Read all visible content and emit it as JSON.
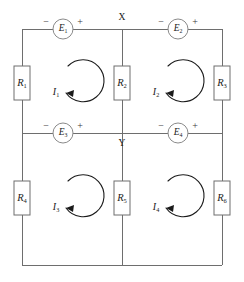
{
  "figure": {
    "background_color": "#ffffff",
    "wire_color": "#6e6e6e",
    "symbol_color": "#8a8a8a",
    "ink_color": "#1a1a1a"
  },
  "nodes": [
    {
      "id": "node-x",
      "label": "X"
    },
    {
      "id": "node-y",
      "label": "Y"
    }
  ],
  "resistors": [
    {
      "id": "r1",
      "label": "R",
      "subscript": "1"
    },
    {
      "id": "r2",
      "label": "R",
      "subscript": "2"
    },
    {
      "id": "r3",
      "label": "R",
      "subscript": "3"
    },
    {
      "id": "r4",
      "label": "R",
      "subscript": "4"
    },
    {
      "id": "r5",
      "label": "R",
      "subscript": "5"
    },
    {
      "id": "r6",
      "label": "R",
      "subscript": "6"
    }
  ],
  "sources": [
    {
      "id": "e1",
      "label": "E",
      "subscript": "1",
      "minus": "−",
      "plus": "+"
    },
    {
      "id": "e2",
      "label": "E",
      "subscript": "2",
      "minus": "−",
      "plus": "+"
    },
    {
      "id": "e3",
      "label": "E",
      "subscript": "3",
      "minus": "−",
      "plus": "+"
    },
    {
      "id": "e4",
      "label": "E",
      "subscript": "4",
      "minus": "−",
      "plus": "+"
    }
  ],
  "currents": [
    {
      "id": "i1",
      "label": "I",
      "subscript": "1",
      "direction": "counterclockwise"
    },
    {
      "id": "i2",
      "label": "I",
      "subscript": "2",
      "direction": "counterclockwise"
    },
    {
      "id": "i3",
      "label": "I",
      "subscript": "3",
      "direction": "counterclockwise"
    },
    {
      "id": "i4",
      "label": "I",
      "subscript": "4",
      "direction": "counterclockwise"
    }
  ]
}
